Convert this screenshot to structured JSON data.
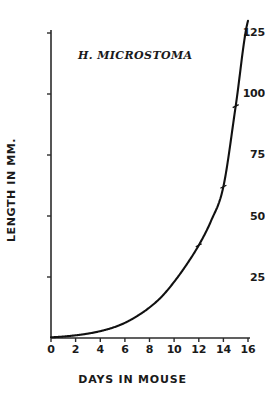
{
  "chart_data": {
    "type": "line",
    "title": "",
    "annotation": "H. MICROSTOMA",
    "xlabel": "DAYS IN MOUSE",
    "ylabel": "LENGTH IN MM.",
    "xlim": [
      0,
      16
    ],
    "ylim": [
      0,
      130
    ],
    "grid": false,
    "legend": "none",
    "xticks": [
      0,
      2,
      4,
      6,
      8,
      10,
      12,
      14,
      16
    ],
    "xtick_labels": [
      "0",
      "2",
      "4",
      "6",
      "8",
      "10",
      "12",
      "14",
      "16"
    ],
    "yticks": [
      0,
      25,
      50,
      75,
      100,
      125
    ],
    "ytick_labels": [
      "",
      "25",
      "50",
      "75",
      "100",
      "125"
    ],
    "series": [
      {
        "name": "H. microstoma length",
        "x": [
          0,
          1,
          2,
          3,
          4,
          5,
          6,
          7,
          8,
          9,
          10,
          11,
          12,
          13,
          14,
          15,
          16
        ],
        "values": [
          0.3,
          0.6,
          1.1,
          1.8,
          2.8,
          4.2,
          6.2,
          9.0,
          12.5,
          17.0,
          23.0,
          30.0,
          38.0,
          48.0,
          62.0,
          95.0,
          130.0
        ]
      }
    ],
    "markers": {
      "label": "data points",
      "x": [
        12,
        14,
        15
      ],
      "values": [
        38.0,
        62.0,
        95.0
      ]
    }
  },
  "axis": {
    "x_start_value": 0,
    "x_end_value": 16,
    "y_start_value": 0,
    "y_end_value": 130
  }
}
